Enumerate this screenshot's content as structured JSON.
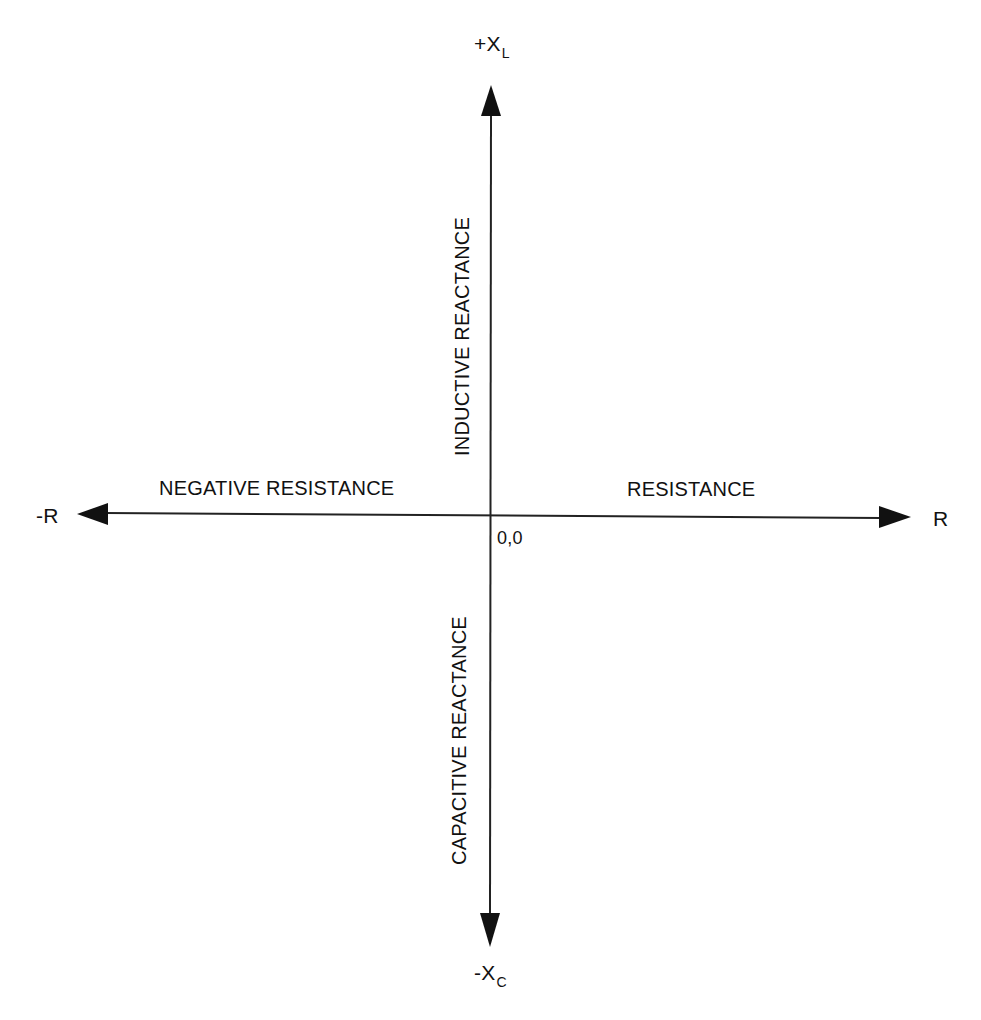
{
  "diagram": {
    "colors": {
      "background": "#ffffff",
      "ink": "#111111"
    },
    "origin": {
      "label": "0,0",
      "x": 490,
      "y": 515
    },
    "axes": {
      "positive_x": {
        "label": "R",
        "region_label": "RESISTANCE"
      },
      "negative_x": {
        "label": "-R",
        "region_label": "NEGATIVE RESISTANCE"
      },
      "positive_y": {
        "label_main": "+X",
        "label_sub": "L",
        "region_label": "INDUCTIVE REACTANCE"
      },
      "negative_y": {
        "label_main": "-X",
        "label_sub": "C",
        "region_label": "CAPACITIVE REACTANCE"
      }
    }
  }
}
